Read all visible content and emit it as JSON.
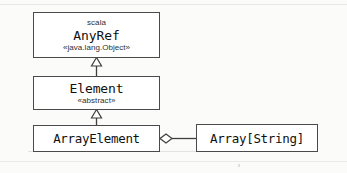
{
  "diagram": {
    "kind": "uml-class-diagram",
    "background_color": "#fbfbfa",
    "line_color": "#3f3f3f",
    "box_fill_color": "#ffffff",
    "classes": [
      {
        "id": "anyref",
        "package": "scala",
        "name": "AnyRef",
        "stereotype": "«java.lang.Object»"
      },
      {
        "id": "element",
        "name": "Element",
        "stereotype": "«abstract»"
      },
      {
        "id": "arrayelement",
        "name": "ArrayElement"
      },
      {
        "id": "arraystring",
        "name": "Array[String]"
      }
    ],
    "relationships": [
      {
        "id": "element-extends-anyref",
        "type": "generalization",
        "from": "Element",
        "to": "AnyRef",
        "arrowhead": "hollow-triangle"
      },
      {
        "id": "arrayelement-extends-element",
        "type": "generalization",
        "from": "ArrayElement",
        "to": "Element",
        "arrowhead": "hollow-triangle"
      },
      {
        "id": "arrayelement-has-arraystring",
        "type": "aggregation",
        "from": "ArrayElement",
        "to": "Array[String]",
        "arrowhead": "hollow-diamond"
      }
    ]
  }
}
